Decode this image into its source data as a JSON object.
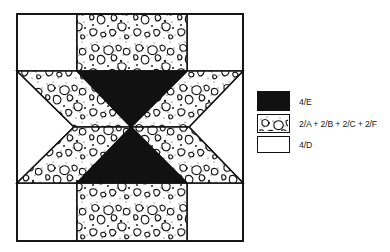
{
  "diagram": {
    "type": "quilt-block",
    "colors": {
      "dark": "#111111",
      "pattern_bg": "#ffffff",
      "pattern_ink": "#111111",
      "white": "#ffffff",
      "outline": "#111111"
    }
  },
  "legend": {
    "items": [
      {
        "swatch": "dark",
        "label": "4/E"
      },
      {
        "swatch": "pattern",
        "label": "2/A + 2/B + 2/C + 2/F"
      },
      {
        "swatch": "white",
        "label": "4/D"
      }
    ]
  }
}
